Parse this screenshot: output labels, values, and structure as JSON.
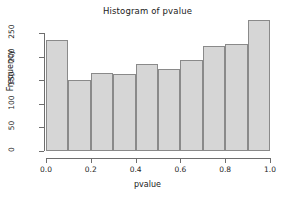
{
  "chart_data": {
    "type": "bar",
    "title": "Histogram of pvalue",
    "xlabel": "pvalue",
    "ylabel": "Frequency",
    "grid": false,
    "legend": null,
    "legend_position": "none",
    "bin_width": 0.1,
    "bin_edges": [
      0.0,
      0.1,
      0.2,
      0.3,
      0.4,
      0.5,
      0.6,
      0.7,
      0.8,
      0.9,
      1.0
    ],
    "categories": [
      "0.0-0.1",
      "0.1-0.2",
      "0.2-0.3",
      "0.3-0.4",
      "0.4-0.5",
      "0.5-0.6",
      "0.6-0.7",
      "0.7-0.8",
      "0.8-0.9",
      "0.9-1.0"
    ],
    "values": [
      235,
      150,
      165,
      163,
      185,
      173,
      192,
      222,
      227,
      278
    ],
    "xlim": [
      0.0,
      1.0
    ],
    "ylim": [
      0,
      280
    ],
    "xticks": [
      0.0,
      0.2,
      0.4,
      0.6,
      0.8,
      1.0
    ],
    "xtick_labels": [
      "0.0",
      "0.2",
      "0.4",
      "0.6",
      "0.8",
      "1.0"
    ],
    "yticks": [
      0,
      50,
      100,
      150,
      200,
      250
    ],
    "ytick_labels": [
      "0",
      "50",
      "100",
      "150",
      "200",
      "250"
    ],
    "bar_fill_color": "#d6d6d6",
    "bar_border_color": "#8a8a8a",
    "axis_color": "#6e6e6e",
    "text_color": "#1a1a1a",
    "background_color": "#ffffff"
  }
}
